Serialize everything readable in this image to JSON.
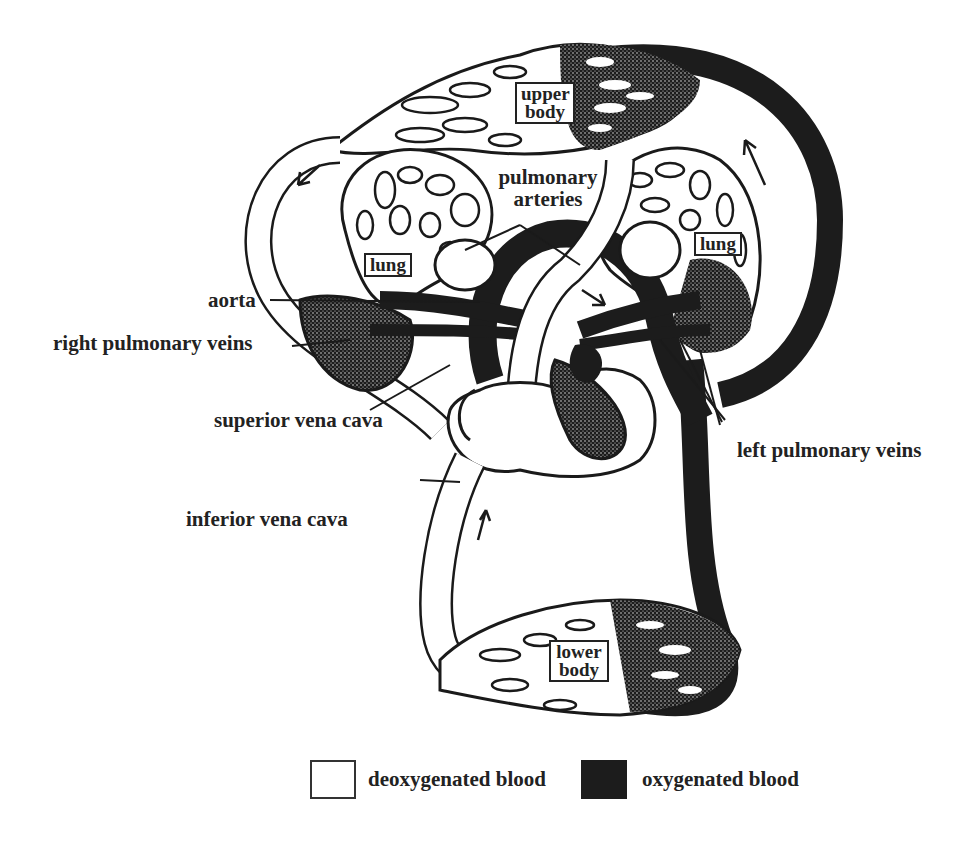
{
  "figure": {
    "colors": {
      "deoxygenated": "#ffffff",
      "oxygenated": "#1c1c1c",
      "outline": "#1a1a1a"
    }
  },
  "regions": {
    "upper_body": {
      "line1": "upper",
      "line2": "body"
    },
    "lower_body": {
      "line1": "lower",
      "line2": "body"
    },
    "lung_right": "lung",
    "lung_left": "lung"
  },
  "labels": {
    "pulmonary_arteries_line1": "pulmonary",
    "pulmonary_arteries_line2": "arteries",
    "aorta": "aorta",
    "right_pulmonary_veins": "right pulmonary veins",
    "superior_vena_cava": "superior vena cava",
    "inferior_vena_cava": "inferior vena cava",
    "left_pulmonary_veins": "left pulmonary veins"
  },
  "legend": [
    {
      "label": "deoxygenated blood",
      "color": "#ffffff"
    },
    {
      "label": "oxygenated blood",
      "color": "#1c1c1c"
    }
  ]
}
